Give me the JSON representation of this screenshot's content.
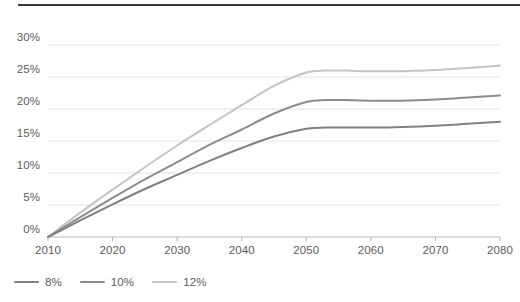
{
  "chart_data": {
    "type": "line",
    "title": "",
    "subtitle": "",
    "xlabel": "",
    "ylabel": "",
    "x": [
      2010,
      2020,
      2030,
      2040,
      2050,
      2060,
      2070,
      2080
    ],
    "xtick_labels": [
      "2010",
      "2020",
      "2030",
      "2040",
      "2050",
      "2060",
      "2070",
      "2080"
    ],
    "ytick_labels": [
      "0%",
      "5%",
      "10%",
      "15%",
      "20%",
      "25%",
      "30%"
    ],
    "ytick_values": [
      0,
      5,
      10,
      15,
      20,
      25,
      30
    ],
    "ylim": [
      0,
      30
    ],
    "xlim": [
      2010,
      2080
    ],
    "grid": "horizontal",
    "legend_position": "bottom-left",
    "series": [
      {
        "name": "8%",
        "color": "#808080",
        "values": [
          0.0,
          5.1,
          9.7,
          13.9,
          16.9,
          17.2,
          17.6,
          18.0
        ],
        "dense_x": [
          2010,
          2015,
          2020,
          2025,
          2030,
          2035,
          2040,
          2045,
          2050,
          2053,
          2056,
          2060,
          2065,
          2070,
          2075,
          2080
        ],
        "dense_values": [
          0.0,
          2.6,
          5.1,
          7.5,
          9.7,
          11.9,
          13.9,
          15.7,
          16.9,
          17.1,
          17.1,
          17.1,
          17.2,
          17.4,
          17.7,
          18.0
        ]
      },
      {
        "name": "10%",
        "color": "#8c8c8c",
        "values": [
          0.0,
          6.1,
          11.7,
          16.8,
          21.1,
          21.3,
          21.6,
          22.1
        ],
        "dense_x": [
          2010,
          2015,
          2020,
          2025,
          2030,
          2035,
          2040,
          2045,
          2050,
          2053,
          2056,
          2060,
          2065,
          2070,
          2075,
          2080
        ],
        "dense_values": [
          0.0,
          3.1,
          6.1,
          9.0,
          11.7,
          14.4,
          16.8,
          19.3,
          21.1,
          21.4,
          21.4,
          21.3,
          21.3,
          21.5,
          21.8,
          22.1
        ]
      },
      {
        "name": "12%",
        "color": "#c4c4c4",
        "values": [
          0.0,
          7.4,
          14.3,
          20.6,
          25.8,
          25.9,
          26.3,
          26.8
        ],
        "dense_x": [
          2010,
          2015,
          2020,
          2025,
          2030,
          2035,
          2040,
          2045,
          2050,
          2053,
          2056,
          2060,
          2065,
          2070,
          2075,
          2080
        ],
        "dense_values": [
          0.0,
          3.8,
          7.4,
          10.9,
          14.3,
          17.5,
          20.6,
          23.6,
          25.7,
          26.0,
          26.0,
          25.9,
          25.9,
          26.1,
          26.4,
          26.8
        ]
      }
    ]
  },
  "axes": {
    "grid_color": "#e3e3e3",
    "axis_color": "#b5b5b5",
    "label_color": "#5a5a5a"
  },
  "decor": {
    "top_rule_color": "#3a3a3a"
  },
  "legend": {
    "items": [
      {
        "label": "8%",
        "color": "#808080"
      },
      {
        "label": "10%",
        "color": "#8c8c8c"
      },
      {
        "label": "12%",
        "color": "#c4c4c4"
      }
    ]
  }
}
